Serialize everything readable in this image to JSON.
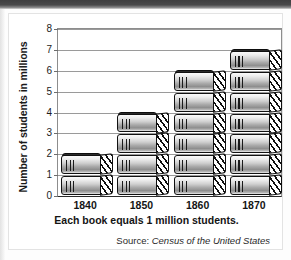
{
  "figure": {
    "y_axis_title": "Number of students in millions",
    "caption": "Each book equals 1 million students.",
    "source_prefix": "Source:",
    "source_title": "Census of the United States"
  },
  "chart_data": {
    "type": "bar",
    "title": "",
    "subtitle": "",
    "xlabel": "",
    "ylabel": "Number of students in millions",
    "categories": [
      "1840",
      "1850",
      "1860",
      "1870"
    ],
    "values": [
      2,
      4,
      6,
      7
    ],
    "unit": "million students",
    "pictogram_unit_label": "Each book equals 1 million students.",
    "pictogram_symbol": "book",
    "ylim": [
      0,
      8
    ],
    "ytick_labels": [
      "0",
      "1",
      "2",
      "3",
      "4",
      "5",
      "6",
      "7",
      "8"
    ],
    "ytick_values": [
      0,
      1,
      2,
      3,
      4,
      5,
      6,
      7,
      8
    ],
    "grid": true,
    "legend": "none",
    "source": "Census of the United States",
    "series": [
      {
        "name": "Number of students in millions",
        "values": [
          2,
          4,
          6,
          7
        ]
      }
    ]
  },
  "colors": {
    "plot_background": "#ffffff",
    "gridline": "#9a9a9a",
    "axis": "#2a2a2a",
    "book_outline": "#111111",
    "book_fill_light": "#f2f2f2",
    "book_fill_dark": "#8e8e8e",
    "text": "#141414"
  }
}
